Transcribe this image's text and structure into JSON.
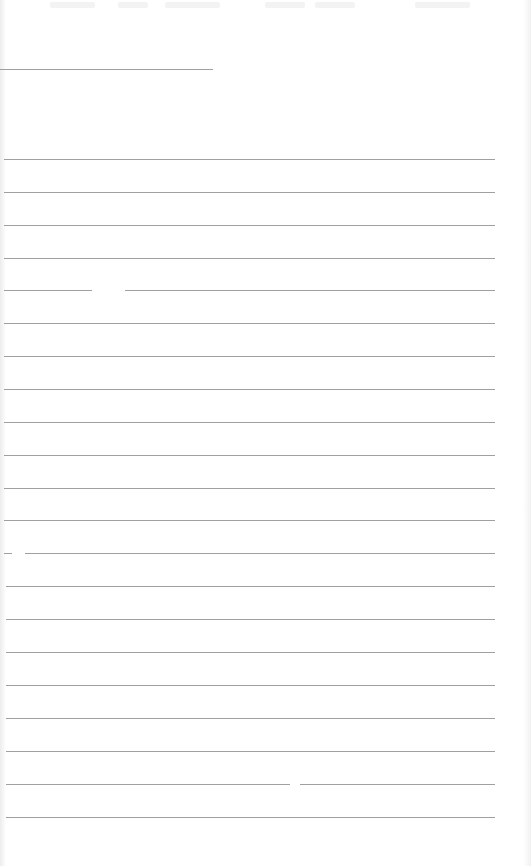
{
  "document": {
    "type": "blank lined form",
    "line_color": "#a0a0a0",
    "background": "#ffffff",
    "header_line": {
      "y": 69,
      "x_start": 0,
      "x_end": 213
    },
    "ruled_lines": [
      {
        "y": 159,
        "x_start": 4,
        "x_end": 495
      },
      {
        "y": 192,
        "x_start": 4,
        "x_end": 495
      },
      {
        "y": 225,
        "x_start": 4,
        "x_end": 495
      },
      {
        "y": 258,
        "x_start": 4,
        "x_end": 495
      },
      {
        "y": 290,
        "x_start": 4,
        "x_end": 495,
        "gap": [
          92,
          125
        ]
      },
      {
        "y": 323,
        "x_start": 4,
        "x_end": 495
      },
      {
        "y": 356,
        "x_start": 4,
        "x_end": 495
      },
      {
        "y": 389,
        "x_start": 4,
        "x_end": 495
      },
      {
        "y": 422,
        "x_start": 4,
        "x_end": 495
      },
      {
        "y": 455,
        "x_start": 4,
        "x_end": 495
      },
      {
        "y": 488,
        "x_start": 4,
        "x_end": 495
      },
      {
        "y": 520,
        "x_start": 4,
        "x_end": 495
      },
      {
        "y": 553,
        "x_start": 4,
        "x_end": 495,
        "gap": [
          12,
          25
        ]
      },
      {
        "y": 586,
        "x_start": 6,
        "x_end": 495
      },
      {
        "y": 619,
        "x_start": 6,
        "x_end": 495
      },
      {
        "y": 652,
        "x_start": 6,
        "x_end": 495
      },
      {
        "y": 685,
        "x_start": 6,
        "x_end": 495
      },
      {
        "y": 718,
        "x_start": 6,
        "x_end": 495
      },
      {
        "y": 751,
        "x_start": 6,
        "x_end": 495
      },
      {
        "y": 784,
        "x_start": 6,
        "x_end": 495,
        "gap": [
          290,
          300
        ]
      },
      {
        "y": 817,
        "x_start": 6,
        "x_end": 495
      }
    ],
    "bleed_through_marks": [
      {
        "x": 50,
        "w": 45
      },
      {
        "x": 118,
        "w": 30
      },
      {
        "x": 165,
        "w": 55
      },
      {
        "x": 265,
        "w": 40
      },
      {
        "x": 315,
        "w": 40
      },
      {
        "x": 415,
        "w": 55
      }
    ]
  }
}
